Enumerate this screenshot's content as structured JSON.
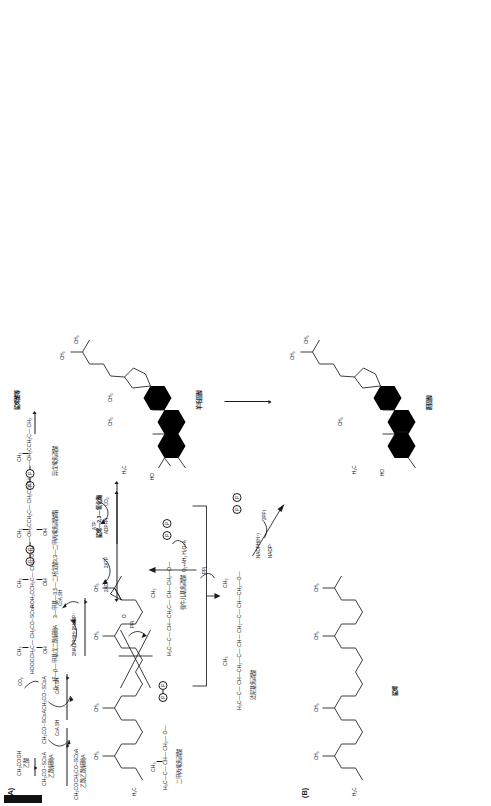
{
  "figure": {
    "panel_a_label": "(A)",
    "panel_b_label": "(B)",
    "panel_a": {
      "title_right": "鲨烯酸等",
      "compounds": {
        "acetic_acid_formula": "CH₃COOH",
        "acetic_acid_name": "乙酸",
        "acetyl_coa_formula": "CH₃CO~SCoA",
        "acetyl_coa_name": "乙酰辅酶A",
        "acetyl_coa_2_formula": "CH₃CO~SCoA",
        "acetyl_coa_2_name": "乙酰辅酶A",
        "acetoacetyl_coa_formula": "CH₃COCH₂CO~SCoA",
        "acetoacetyl_coa_name": "乙酰乙酰辅酶A",
        "hmg_coa_formula_left": "HOOCCH₂C— CH₂CO~SCoA",
        "hmg_coa_name": "β—羟—β—甲基戊二酰辅酶A",
        "hmg_coa_top_ch3": "CH₃",
        "hmg_coa_oh": "OH",
        "mevalonate_formula": "HOH₂CCH₂C— CH₂COOH",
        "mevalonate_name": "3—甲基—3,5—二羟戊酸",
        "mevalonate_top_ch3": "CH₃",
        "mevalonate_oh": "OH",
        "mvapp_formula": "—OH₂CCH₂C— CH₂COOH",
        "mvapp_name": "3,3—二甲丙烯焦磷酸酯",
        "mvapp_top_ch3": "CH₃",
        "mvapp_oh": "OH",
        "isopentenyl_name": "异戊烯焦磷酸",
        "isopentenyl_top_ch3": "CH₃",
        "isopentenyl_formula": "—OH₂CCH₂C— CH₂",
        "dimethylallyl_name": "二甲丙烯焦磷酸",
        "dimethylallyl_top_ch3": "CH₃",
        "dimethylallyl_formula": "H₃C—C— CH— CH₂— O—",
        "geranyl_name": "牻牛儿基焦磷酸",
        "geranyl_formula": "H₃C—C— CH—CH₂C— CH—CH₂—O—",
        "geranyl_ch3": "CH₃",
        "farnesyl_name": "法尼基焦磷酸",
        "farnesyl_formula": "H₃C—C— CH—CH₂—C— CH— CH₂—C— CH—CH₂—O—",
        "farnesyl_ch3_1": "CH₃",
        "farnesyl_ch3_2": "CH₃",
        "squalene_branch": "鲨烯酸等",
        "top_ch3_first": "CH₃",
        "top_ch3_second": "CH₃",
        "first_oh": "OH",
        "first_chain_left": "CH₃—C—",
        "first_chain_right": "CH₂CO~SCoA"
      },
      "cofactors": {
        "coa_sh_1": "CoA SH",
        "coa_sh_2": "CoA SH",
        "coa_sh_3": "CoA SH",
        "co2": "CO₂",
        "nadph": "2NADPH(H⁺)",
        "nadp": "2NADP⁺",
        "adp2": "2ADP",
        "atp2": "2ATP",
        "atp": "ATP",
        "adp_pi": "ADP+Pi",
        "co2_single": "CO₂",
        "ppi_1": "PPi",
        "ppi_2": "PPi"
      }
    },
    "panel_b": {
      "labels": {
        "squalene": "鲨烯",
        "squalene_epoxidase": "鲨烯—2,3—氧化酶",
        "lanosterol": "羊毛固醇",
        "cholesterol": "胆固醇",
        "nadph": "NADPH(H⁺)",
        "nadp": "NADP⁺",
        "ppi2": "2PPi",
        "o2_reagents": "O₂+AH₂ H₂O+A",
        "ch3": "CH₃",
        "h3c": "H₃C",
        "ho": "HO",
        "o": "O"
      },
      "methyls": [
        "CH₃",
        "CH₃",
        "CH₃",
        "CH₃",
        "CH₃",
        "CH₃",
        "CH₃",
        "CH₃",
        "CH₃",
        "CH₃"
      ]
    }
  },
  "colors": {
    "ink": "#1a1a1a",
    "paper": "#ffffff"
  }
}
